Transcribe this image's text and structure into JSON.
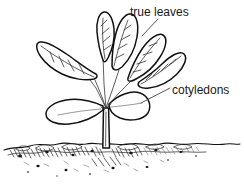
{
  "figure": {
    "style": "black and white line drawing",
    "background_color": "#ffffff",
    "ink_color": "#111111",
    "width": 244,
    "height": 186
  },
  "labels": [
    {
      "id": "true-leaves",
      "text": "true leaves",
      "x": 130,
      "y": 16,
      "points_to": "upper-foliage-leaves"
    },
    {
      "id": "cotyledons",
      "text": "cotyledons",
      "x": 172,
      "y": 94,
      "points_to": "seed-leaves"
    }
  ],
  "leaders": [
    {
      "id": "true-leaves-leader",
      "from_x": 158,
      "from_y": 19,
      "to_x": 142,
      "to_y": 36
    },
    {
      "id": "cotyledons-leader",
      "from_x": 170,
      "from_y": 88,
      "to_x": 141,
      "to_y": 103
    }
  ],
  "plant": {
    "stem": {
      "x": 106,
      "top_y": 108,
      "bottom_y": 150,
      "width": 6
    },
    "true_leaves_count": 5,
    "cotyledons_count": 2
  },
  "ground": {
    "soil_line_y": 146,
    "soil_depth": 30
  }
}
